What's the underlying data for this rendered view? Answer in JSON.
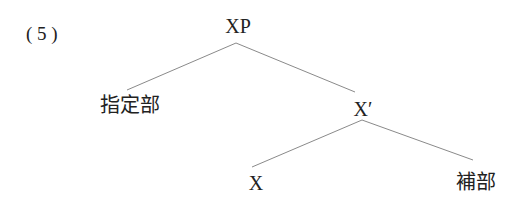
{
  "example_number": "( 5 )",
  "tree": {
    "root": "XP",
    "specifier": "指定部",
    "intermediate": "X′",
    "head": "X",
    "complement": "補部"
  },
  "colors": {
    "text": "#222222",
    "edges": "#8a8a8a",
    "background": "#ffffff"
  }
}
